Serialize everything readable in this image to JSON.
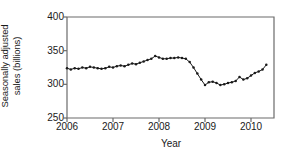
{
  "chart_data": {
    "type": "line",
    "title": "",
    "xlabel": "Year",
    "ylabel": "Seasonally adjusted sales (billions)",
    "ylabel_line1": "Seasonally adjusted",
    "ylabel_line2": "sales (billions)",
    "xlim": [
      2006.0,
      2010.5
    ],
    "ylim": [
      250,
      400
    ],
    "yticks": [
      250,
      300,
      350,
      400
    ],
    "ytick_labels": [
      "250",
      "300",
      "350",
      "400"
    ],
    "xticks": [
      2006,
      2007,
      2008,
      2009,
      2010
    ],
    "xtick_labels": [
      "2006",
      "2007",
      "2008",
      "2009",
      "2010"
    ],
    "grid": false,
    "legend": false,
    "marker": "filled-circle",
    "line_color": "#1a1a1a",
    "marker_color": "#1a1a1a",
    "axis_color": "#4a4a4a",
    "background_color": "#ffffff",
    "x": [
      2006.0,
      2006.083,
      2006.167,
      2006.25,
      2006.333,
      2006.417,
      2006.5,
      2006.583,
      2006.667,
      2006.75,
      2006.833,
      2006.917,
      2007.0,
      2007.083,
      2007.167,
      2007.25,
      2007.333,
      2007.417,
      2007.5,
      2007.583,
      2007.667,
      2007.75,
      2007.833,
      2007.917,
      2008.0,
      2008.083,
      2008.167,
      2008.25,
      2008.333,
      2008.417,
      2008.5,
      2008.583,
      2008.667,
      2008.75,
      2008.833,
      2008.917,
      2009.0,
      2009.083,
      2009.167,
      2009.25,
      2009.333,
      2009.417,
      2009.5,
      2009.583,
      2009.667,
      2009.75,
      2009.833,
      2009.917,
      2010.0,
      2010.083,
      2010.167,
      2010.25,
      2010.333
    ],
    "values": [
      324,
      322,
      324,
      323,
      325,
      324,
      326,
      325,
      324,
      323,
      324,
      326,
      325,
      327,
      328,
      327,
      329,
      331,
      330,
      332,
      334,
      336,
      338,
      342,
      340,
      338,
      338,
      339,
      339,
      340,
      339,
      338,
      333,
      325,
      316,
      307,
      299,
      303,
      304,
      302,
      299,
      300,
      302,
      303,
      305,
      311,
      307,
      309,
      313,
      317,
      319,
      322,
      329
    ],
    "series_name": "Seasonally adjusted sales"
  }
}
